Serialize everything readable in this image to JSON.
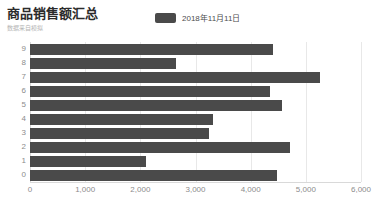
{
  "header": {
    "title": "商品销售额汇总",
    "subtitle": "数据来自模拟"
  },
  "legend": {
    "position": "top-center",
    "swatch_color": "#4a4a4a",
    "entries": [
      {
        "label": "2018年11月11日",
        "color": "#4a4a4a"
      }
    ]
  },
  "chart_data": {
    "type": "bar",
    "orientation": "horizontal",
    "title": "商品销售额汇总",
    "subtitle": "数据来自模拟",
    "xlabel": "",
    "ylabel": "",
    "xlim": [
      0,
      6000
    ],
    "xticks": [
      0,
      1000,
      2000,
      3000,
      4000,
      5000,
      6000
    ],
    "xtick_labels": [
      "0",
      "1,000",
      "2,000",
      "3,000",
      "4,000",
      "5,000",
      "6,000"
    ],
    "grid": true,
    "grid_axis": "x",
    "legend_position": "top-center",
    "bar_color": "#4a4a4a",
    "categories": [
      "9",
      "8",
      "7",
      "6",
      "5",
      "4",
      "3",
      "2",
      "1",
      "0"
    ],
    "series": [
      {
        "name": "2018年11月11日",
        "color": "#4a4a4a",
        "values": [
          4400,
          2640,
          5250,
          4350,
          4560,
          3310,
          3240,
          4710,
          2110,
          4470
        ]
      }
    ]
  }
}
